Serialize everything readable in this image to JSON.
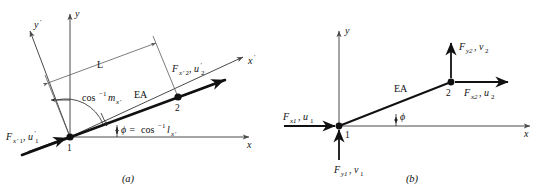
{
  "figure": {
    "panels": [
      {
        "id": "a",
        "caption": "(a)",
        "axes": {
          "y_label": "y",
          "x_label": "x",
          "y_prime_label": "y",
          "y_prime_mark": "′",
          "x_prime_label": "x",
          "x_prime_mark": "′"
        },
        "member": {
          "stiffness_label": "EA",
          "length_label": "L",
          "node1": "1",
          "node2": "2"
        },
        "angles": {
          "m_label_base": "cos",
          "m_label_exp": "−1",
          "m_label_var": "m",
          "m_label_sub": "x",
          "m_label_sub_mark": "′",
          "phi_label": "ϕ = ",
          "phi_base": "cos",
          "phi_exp": "−1",
          "phi_var": "l",
          "phi_sub": "x",
          "phi_sub_mark": "′"
        },
        "forces": [
          {
            "name": "force-node1-local",
            "sym1": "F",
            "sub1": "x",
            "sub1_mark": "′",
            "sub1_num": "1",
            "comma": ", ",
            "sym2": "u",
            "sym2_mark": "′",
            "sub2_num": "1"
          },
          {
            "name": "force-node2-local",
            "sym1": "F",
            "sub1": "x",
            "sub1_mark": "′",
            "sub1_num": "2",
            "comma": ", ",
            "sym2": "u",
            "sym2_mark": "′",
            "sub2_num": "2"
          }
        ]
      },
      {
        "id": "b",
        "caption": "(b)",
        "axes": {
          "y_label": "y",
          "x_label": "x"
        },
        "member": {
          "stiffness_label": "EA",
          "node1": "1",
          "node2": "2"
        },
        "angles": {
          "phi_label": "ϕ"
        },
        "forces": [
          {
            "name": "force-node1-x",
            "sym1": "F",
            "sub1": "x1",
            "comma": ", ",
            "sym2": "u",
            "sub2": "1"
          },
          {
            "name": "force-node1-y",
            "sym1": "F",
            "sub1": "y1",
            "comma": ", ",
            "sym2": "v",
            "sub2": "1"
          },
          {
            "name": "force-node2-x",
            "sym1": "F",
            "sub1": "x2",
            "comma": ", ",
            "sym2": "u",
            "sub2": "2"
          },
          {
            "name": "force-node2-y",
            "sym1": "F",
            "sub1": "y2",
            "comma": ", ",
            "sym2": "v",
            "sub2": "2"
          }
        ]
      }
    ]
  }
}
